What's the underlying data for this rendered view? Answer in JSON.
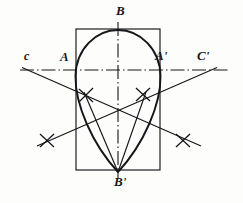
{
  "figure": {
    "background_color": "#fdfdfb",
    "ink_color": "#16161a",
    "labels": [
      {
        "name": "point-label-b",
        "text": "B",
        "x": 116,
        "y": 6,
        "id": "B"
      },
      {
        "name": "point-label-c",
        "text": "c",
        "x": 24,
        "y": 50,
        "id": "C"
      },
      {
        "name": "point-label-a",
        "text": "A",
        "x": 60,
        "y": 52,
        "id": "A"
      },
      {
        "name": "point-label-a-prime",
        "text": "A'",
        "x": 155,
        "y": 51,
        "id": "A'"
      },
      {
        "name": "point-label-c-prime",
        "text": "C'",
        "x": 197,
        "y": 50,
        "id": "C'"
      },
      {
        "name": "point-label-b-prime",
        "text": "B'",
        "x": 114,
        "y": 175,
        "id": "B'"
      }
    ],
    "rectangle": {
      "x": 76,
      "y": 29,
      "width": 84,
      "height": 141
    },
    "axes": {
      "horizontal": {
        "y": 70,
        "x1": 20,
        "x2": 228,
        "style": "dash-dot"
      },
      "vertical": {
        "x": 118,
        "y1": 22,
        "y2": 178,
        "style": "dash-dot"
      }
    },
    "key_points": {
      "A": {
        "x": 76,
        "y": 70
      },
      "Ap": {
        "x": 160,
        "y": 70
      },
      "B": {
        "x": 118,
        "y": 30
      },
      "Bp": {
        "x": 118,
        "y": 172
      },
      "C": {
        "x": 30,
        "y": 68
      },
      "Cp": {
        "x": 210,
        "y": 68
      },
      "center": {
        "x": 118,
        "y": 112
      }
    },
    "tick_marks": [
      {
        "name": "tick-mark-upper-left",
        "x": 86,
        "y": 95,
        "angle": 20
      },
      {
        "name": "tick-mark-upper-right",
        "x": 143,
        "y": 94,
        "angle": -20
      },
      {
        "name": "tick-mark-lower-left",
        "x": 47,
        "y": 140,
        "angle": 15
      },
      {
        "name": "tick-mark-lower-right",
        "x": 183,
        "y": 140,
        "angle": -15
      }
    ],
    "construction_lines": [
      {
        "name": "diagonal-from-c",
        "x1": 22,
        "y1": 68,
        "x2": 200,
        "y2": 146
      },
      {
        "name": "diagonal-from-c-prime",
        "x1": 216,
        "y1": 68,
        "x2": 38,
        "y2": 146
      }
    ],
    "oval": {
      "name": "egg-oval-outline",
      "top": {
        "x": 118,
        "y": 30
      },
      "bottom": {
        "x": 118,
        "y": 172
      },
      "left_extreme": {
        "x": 75,
        "y": 78
      },
      "right_extreme": {
        "x": 161,
        "y": 78
      }
    }
  }
}
